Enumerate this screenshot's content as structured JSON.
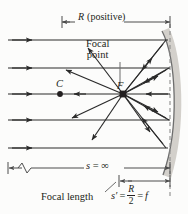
{
  "figure": {
    "labels": {
      "radius": "R (positive)",
      "radius_symbol": "R",
      "radius_qualifier": "(positive)",
      "focal_point_line1": "Focal",
      "focal_point_line2": "point",
      "center_of_curvature": "C",
      "focal_point_symbol": "F",
      "object_distance": "s = ∞",
      "object_distance_symbol": "s",
      "object_distance_equals": "=",
      "object_distance_value": "∞",
      "focal_length_text": "Focal length",
      "image_distance_symbol": "s′",
      "equals_1": "=",
      "fraction_numerator": "R",
      "fraction_denominator": "2",
      "equals_2": "=",
      "focal_length_symbol": "f"
    },
    "colors": {
      "ink": "#231f20",
      "ray": "#2a2a2a",
      "dimension": "#4d4d4d",
      "mirror_shadow": "#c9c6c0",
      "mirror_line": "#6b6b6b",
      "dashed_axis": "#8a8a8a",
      "background": "#fcfcfb"
    },
    "geometry": {
      "incoming_ray_y": [
        40,
        68,
        94,
        120,
        148
      ],
      "focal_point": [
        123,
        94
      ],
      "center_point": [
        60,
        94
      ],
      "mirror_vertex_x": 170,
      "dashed_line_x": 170,
      "radius_dim_y": 22,
      "s_dim_y": 168,
      "f_dim_y": 181
    },
    "icon_names": {
      "arrowhead": "arrow-head-icon",
      "break_symbol": "dimension-break-icon",
      "dimension_tick": "dimension-tick-icon"
    }
  }
}
